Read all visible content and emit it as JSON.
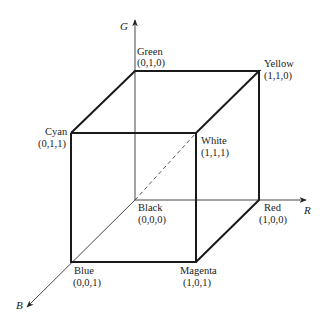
{
  "diagram": {
    "type": "rgb-color-cube",
    "axes": [
      {
        "id": "G",
        "label": "G"
      },
      {
        "id": "R",
        "label": "R"
      },
      {
        "id": "B",
        "label": "B"
      }
    ],
    "vertices": [
      {
        "id": "green",
        "name": "Green",
        "coords": "(0,1,0)"
      },
      {
        "id": "yellow",
        "name": "Yellow",
        "coords": "(1,1,0)"
      },
      {
        "id": "cyan",
        "name": "Cyan",
        "coords": "(0,1,1)"
      },
      {
        "id": "white",
        "name": "White",
        "coords": "(1,1,1)"
      },
      {
        "id": "black",
        "name": "Black",
        "coords": "(0,0,0)"
      },
      {
        "id": "red",
        "name": "Red",
        "coords": "(1,0,0)"
      },
      {
        "id": "blue",
        "name": "Blue",
        "coords": "(0,0,1)"
      },
      {
        "id": "magenta",
        "name": "Magenta",
        "coords": "(1,0,1)"
      }
    ],
    "diagonal": {
      "from": "black",
      "to": "white",
      "style": "dashed"
    },
    "colors": {
      "line": "#1a1a1a",
      "axis": "#333333",
      "background": "#ffffff"
    }
  }
}
